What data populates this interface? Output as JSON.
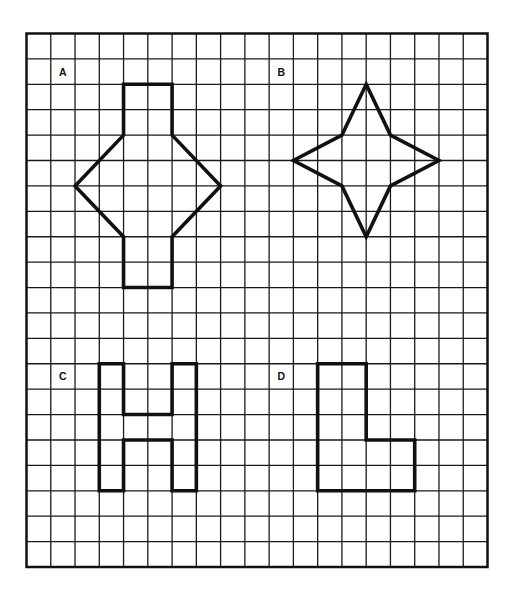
{
  "grid": {
    "columns": 19,
    "rows": 21,
    "line_color": "#1a1a1a"
  },
  "figures": [
    {
      "label": "A",
      "label_cell": [
        1,
        1
      ],
      "description": "rectangle-diamond-rectangle shape",
      "vertices": [
        [
          4,
          2
        ],
        [
          6,
          2
        ],
        [
          6,
          4
        ],
        [
          8,
          6
        ],
        [
          6,
          8
        ],
        [
          6,
          10
        ],
        [
          4,
          10
        ],
        [
          4,
          8
        ],
        [
          2,
          6
        ],
        [
          4,
          4
        ]
      ]
    },
    {
      "label": "B",
      "label_cell": [
        10,
        1
      ],
      "description": "four-pointed star",
      "vertices": [
        [
          14,
          2
        ],
        [
          15,
          4
        ],
        [
          17,
          5
        ],
        [
          15,
          6
        ],
        [
          14,
          8
        ],
        [
          13,
          6
        ],
        [
          11,
          5
        ],
        [
          13,
          4
        ]
      ]
    },
    {
      "label": "C",
      "label_cell": [
        1,
        13
      ],
      "description": "H shape",
      "vertices": [
        [
          3,
          13
        ],
        [
          4,
          13
        ],
        [
          4,
          15
        ],
        [
          6,
          15
        ],
        [
          6,
          13
        ],
        [
          7,
          13
        ],
        [
          7,
          18
        ],
        [
          6,
          18
        ],
        [
          6,
          16
        ],
        [
          4,
          16
        ],
        [
          4,
          18
        ],
        [
          3,
          18
        ]
      ]
    },
    {
      "label": "D",
      "label_cell": [
        10,
        13
      ],
      "description": "L shape",
      "vertices": [
        [
          12,
          13
        ],
        [
          14,
          13
        ],
        [
          14,
          16
        ],
        [
          16,
          16
        ],
        [
          16,
          18
        ],
        [
          12,
          18
        ]
      ]
    }
  ]
}
